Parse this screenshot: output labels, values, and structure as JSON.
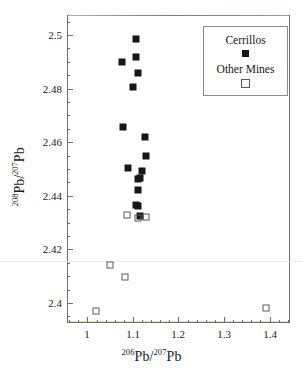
{
  "chart_data": {
    "type": "scatter",
    "title": "",
    "xlabel": "206Pb/207Pb",
    "ylabel": "208Pb/207Pb",
    "xlabel_parts": {
      "sup1": "206",
      "mid": "Pb/",
      "sup2": "207",
      "end": "Pb"
    },
    "ylabel_parts": {
      "sup1": "208",
      "mid": "Pb/",
      "sup2": "207",
      "end": "Pb"
    },
    "xlim": [
      0.955,
      1.445
    ],
    "ylim": [
      2.3925,
      2.5075
    ],
    "grid": false,
    "legend_position": "top-right",
    "xticks": [
      "1",
      "1.1",
      "1.2",
      "1.3",
      "1.4"
    ],
    "xtick_values": [
      1.0,
      1.1,
      1.2,
      1.3,
      1.4
    ],
    "yticks": [
      "2.5",
      "2.48",
      "2.46",
      "2.44",
      "2.42",
      "2.4"
    ],
    "ytick_values": [
      2.5,
      2.48,
      2.46,
      2.44,
      2.42,
      2.4
    ],
    "series": [
      {
        "name": "Cerrillos",
        "marker": "filled-square",
        "color": "#161616",
        "points": [
          [
            1.107,
            2.4985
          ],
          [
            1.107,
            2.492
          ],
          [
            1.076,
            2.49
          ],
          [
            1.11,
            2.486
          ],
          [
            1.099,
            2.4805
          ],
          [
            1.078,
            2.4655
          ],
          [
            1.127,
            2.462
          ],
          [
            1.129,
            2.455
          ],
          [
            1.09,
            2.4503
          ],
          [
            1.12,
            2.4492
          ],
          [
            1.11,
            2.4462
          ],
          [
            1.116,
            2.4467
          ],
          [
            1.11,
            2.442
          ],
          [
            1.107,
            2.4365
          ],
          [
            1.112,
            2.436
          ],
          [
            1.116,
            2.4325
          ]
        ]
      },
      {
        "name": "Other Mines",
        "marker": "open-square",
        "color": "#585860",
        "points": [
          [
            1.086,
            2.433
          ],
          [
            1.11,
            2.4318
          ],
          [
            1.128,
            2.432
          ],
          [
            1.049,
            2.4143
          ],
          [
            1.083,
            2.4098
          ],
          [
            1.019,
            2.3968
          ],
          [
            1.393,
            2.398
          ]
        ]
      }
    ]
  },
  "legend": {
    "entries": [
      {
        "label": "Cerrillos",
        "marker": "filled-square"
      },
      {
        "label": "Other Mines",
        "marker": "open-square"
      }
    ]
  }
}
